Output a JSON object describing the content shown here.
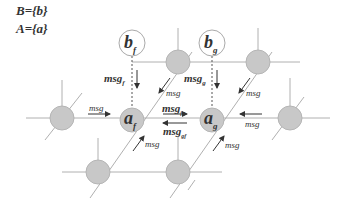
{
  "legend": {
    "set_b": "B={b}",
    "set_a": "A={a}"
  },
  "nodes": {
    "b_f": {
      "base": "b",
      "sub": "f"
    },
    "b_g": {
      "base": "b",
      "sub": "g"
    },
    "a_f": {
      "base": "a",
      "sub": "f"
    },
    "a_g": {
      "base": "a",
      "sub": "g"
    }
  },
  "messages": {
    "msg_f": {
      "base": "msg",
      "sub": "f"
    },
    "msg_g": {
      "base": "msg",
      "sub": "g"
    },
    "msg_fg": {
      "base": "msg",
      "sub": "fg"
    },
    "msg_gf": {
      "base": "msg",
      "sub": "gf"
    },
    "generic": "msg"
  },
  "colors": {
    "gray_node": "#c8c8c8",
    "line": "#aaaaaa",
    "text": "#333333"
  }
}
